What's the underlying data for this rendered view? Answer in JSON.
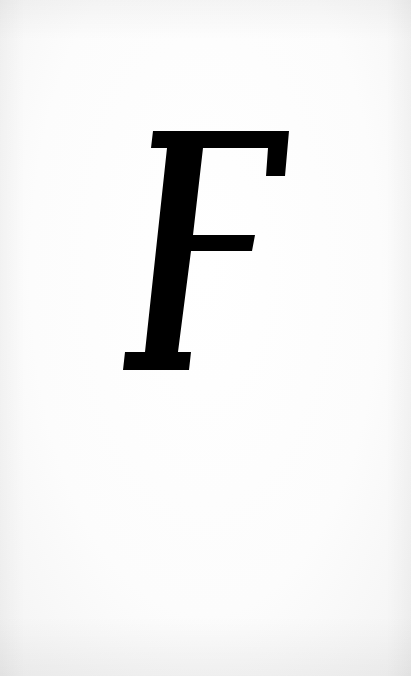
{
  "page": {
    "letter": "F",
    "style": "italic serif",
    "colors": {
      "paper": "#fdfdfd",
      "ink": "#000000"
    }
  }
}
